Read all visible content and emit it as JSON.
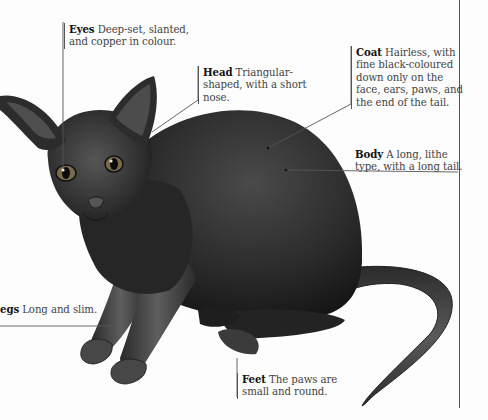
{
  "illustration": {
    "subject": "Black hairless cat (Sphynx-type) in crouching pose",
    "colors": {
      "fur_dark": "#1c1c1c",
      "fur_mid": "#3a3a3a",
      "highlight": "#6a6a6a",
      "eye": "#8a6a3a",
      "leader_line": "#555555",
      "background": "#fdfdfd"
    }
  },
  "callouts": {
    "eyes": {
      "heading": "Eyes",
      "text": " Deep-set, slanted, and copper in colour."
    },
    "head": {
      "heading": "Head",
      "text": " Triangular-shaped, with a short nose."
    },
    "coat": {
      "heading": "Coat",
      "text": " Hairless, with fine black-coloured down only on the face, ears, paws, and the end of the tail."
    },
    "body": {
      "heading": "Body",
      "text": " A long, lithe type, with a long tail."
    },
    "legs": {
      "heading": "egs",
      "text": " Long and slim."
    },
    "feet": {
      "heading": "Feet",
      "text": " The paws are small and round."
    }
  }
}
